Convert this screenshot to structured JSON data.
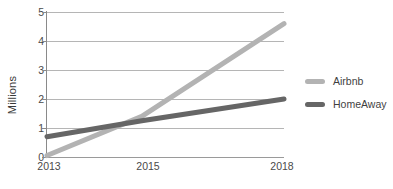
{
  "chart_data": {
    "type": "line",
    "title": "",
    "subtitle": "",
    "xlabel": "",
    "ylabel": "Millions",
    "x": [
      2013,
      2015,
      2018
    ],
    "xtick_labels": [
      "2013",
      "2015",
      "2018"
    ],
    "ytick_labels": [
      "0",
      "1",
      "2",
      "3",
      "4",
      "5"
    ],
    "yticks": [
      0,
      1,
      2,
      3,
      4,
      5
    ],
    "ylim": [
      0,
      5
    ],
    "xlim": [
      2013,
      2018
    ],
    "grid": true,
    "legend_position": "right",
    "series": [
      {
        "name": "Airbnb",
        "color": "#b3b3b3",
        "values": [
          0.05,
          1.4,
          4.6
        ]
      },
      {
        "name": "HomeAway",
        "color": "#666666",
        "values": [
          0.7,
          1.25,
          2.0
        ]
      }
    ]
  },
  "legend": {
    "items": [
      {
        "label": "Airbnb",
        "color": "#b3b3b3"
      },
      {
        "label": "HomeAway",
        "color": "#666666"
      }
    ]
  },
  "axes": {
    "y_title": "Millions",
    "y_ticks": [
      "5",
      "4",
      "3",
      "2",
      "1",
      "0"
    ],
    "x_ticks": [
      "2013",
      "2015",
      "2018"
    ]
  },
  "colors": {
    "airbnb": "#b3b3b3",
    "homeaway": "#666666",
    "gridline": "#b5b5b5",
    "axis": "#8a8a8a",
    "text": "#4a4a4a",
    "background": "#ffffff"
  }
}
